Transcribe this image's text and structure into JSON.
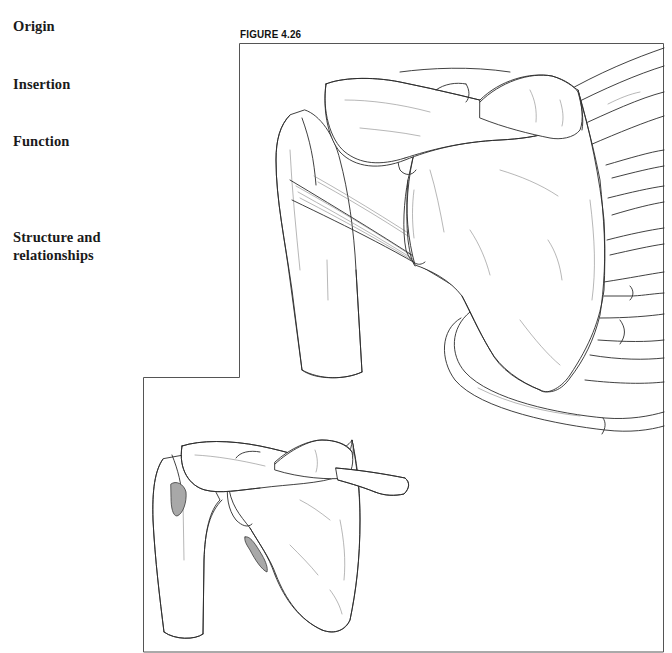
{
  "page": {
    "section_headings": [
      {
        "label": "Origin"
      },
      {
        "label": "Insertion"
      },
      {
        "label": "Function"
      },
      {
        "label": "Structure and relationships",
        "lines": [
          "Structure and",
          "relationships"
        ]
      }
    ]
  },
  "figure": {
    "label": "FIGURE 4.26",
    "main_illustration": "shoulder-posterior-view-line-art",
    "inset_illustration": "scapula-humerus-with-shaded-attachment-areas",
    "shade_color": "#a8a8a8",
    "line_color": "#2b2b2b",
    "frame_color": "#555555"
  }
}
